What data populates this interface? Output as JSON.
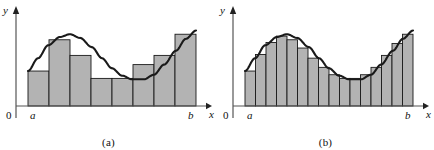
{
  "figure": {
    "panels": [
      {
        "id": "a",
        "caption": "(a)",
        "y_axis_label": "y",
        "x_axis_label": "x",
        "origin_label": "0",
        "left_bound_label": "a",
        "right_bound_label": "b",
        "n_rectangles": 8,
        "rect_heights": [
          0.38,
          0.72,
          0.55,
          0.3,
          0.3,
          0.45,
          0.55,
          0.78
        ],
        "fill_color": "#b3b3b3",
        "stroke_color": "#1a1a1a",
        "curve_color": "#1a1a1a",
        "axis_color": "#555555"
      },
      {
        "id": "b",
        "caption": "(b)",
        "y_axis_label": "y",
        "x_axis_label": "x",
        "origin_label": "0",
        "left_bound_label": "a",
        "right_bound_label": "b",
        "n_rectangles": 16,
        "rect_heights": [
          0.38,
          0.56,
          0.69,
          0.76,
          0.72,
          0.63,
          0.52,
          0.42,
          0.34,
          0.3,
          0.3,
          0.34,
          0.42,
          0.55,
          0.68,
          0.78
        ],
        "fill_color": "#b3b3b3",
        "stroke_color": "#1a1a1a",
        "curve_color": "#1a1a1a",
        "axis_color": "#555555"
      }
    ]
  },
  "chart_data": {
    "type": "area",
    "xlabel": "x",
    "ylabel": "y",
    "xlim": [
      0,
      1
    ],
    "ylim": [
      0,
      1
    ],
    "grid": false,
    "legend": null,
    "annotations": [
      "0",
      "a",
      "b",
      "(a)",
      "(b)"
    ],
    "curve": {
      "name": "f(x)",
      "description": "Smooth wave: rises from a to a crest, falls to a trough, rises again to b",
      "x": [
        0.0,
        0.06,
        0.12,
        0.19,
        0.25,
        0.31,
        0.38,
        0.44,
        0.5,
        0.56,
        0.62,
        0.69,
        0.75,
        0.81,
        0.88,
        0.94,
        1.0
      ],
      "y": [
        0.38,
        0.52,
        0.66,
        0.75,
        0.78,
        0.74,
        0.64,
        0.52,
        0.41,
        0.33,
        0.29,
        0.29,
        0.34,
        0.45,
        0.6,
        0.73,
        0.82
      ]
    },
    "series": [
      {
        "name": "(a) 8 rectangles",
        "type": "bar",
        "n": 8,
        "categories": [
          "1",
          "2",
          "3",
          "4",
          "5",
          "6",
          "7",
          "8"
        ],
        "values": [
          0.38,
          0.72,
          0.55,
          0.3,
          0.3,
          0.45,
          0.55,
          0.78
        ]
      },
      {
        "name": "(b) 16 rectangles",
        "type": "bar",
        "n": 16,
        "categories": [
          "1",
          "2",
          "3",
          "4",
          "5",
          "6",
          "7",
          "8",
          "9",
          "10",
          "11",
          "12",
          "13",
          "14",
          "15",
          "16"
        ],
        "values": [
          0.38,
          0.56,
          0.69,
          0.76,
          0.72,
          0.63,
          0.52,
          0.42,
          0.34,
          0.3,
          0.3,
          0.34,
          0.42,
          0.55,
          0.68,
          0.78
        ]
      }
    ]
  }
}
